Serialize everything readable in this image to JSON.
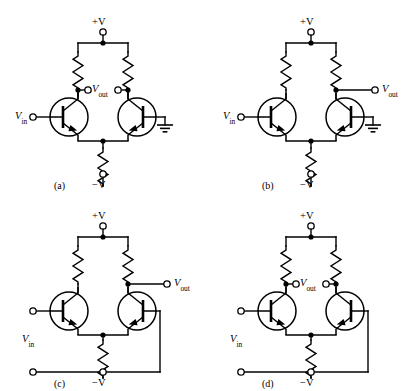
{
  "figure": {
    "background_color": "#ffffff",
    "line_color": "#000000",
    "width": 417,
    "height": 391
  },
  "labels": {
    "supply_positive": "+V",
    "supply_negative": "−V",
    "v_in_prefix": "V",
    "v_in_sub": "in",
    "v_out_prefix": "V",
    "v_out_sub": "out"
  },
  "captions": {
    "a": "(a)",
    "b": "(b)",
    "c": "(c)",
    "d": "(d)"
  },
  "circuits": [
    {
      "id": "a",
      "caption": "(a)",
      "input_mode": "single-ended",
      "output_mode": "double-ended",
      "input_terminals": 1,
      "output_terminals": 2,
      "grounded_base": "right",
      "feedback_wire": false,
      "supply_top": "+V",
      "supply_bottom": "−V",
      "input_label": "V",
      "input_sub": "in",
      "output_label": "V",
      "output_sub": "out",
      "transistors": 2,
      "resistors": 3,
      "ground_symbol": true
    },
    {
      "id": "b",
      "caption": "(b)",
      "input_mode": "single-ended",
      "output_mode": "single-ended",
      "input_terminals": 1,
      "output_terminals": 1,
      "grounded_base": "right",
      "feedback_wire": false,
      "supply_top": "+V",
      "supply_bottom": "−V",
      "input_label": "V",
      "input_sub": "in",
      "output_label": "V",
      "output_sub": "out",
      "transistors": 2,
      "resistors": 3,
      "ground_symbol": true
    },
    {
      "id": "c",
      "caption": "(c)",
      "input_mode": "double-ended",
      "output_mode": "single-ended",
      "input_terminals": 2,
      "output_terminals": 1,
      "grounded_base": "none",
      "feedback_wire": true,
      "supply_top": "+V",
      "supply_bottom": "−V",
      "input_label": "V",
      "input_sub": "in",
      "output_label": "V",
      "output_sub": "out",
      "transistors": 2,
      "resistors": 3,
      "ground_symbol": false
    },
    {
      "id": "d",
      "caption": "(d)",
      "input_mode": "double-ended",
      "output_mode": "double-ended",
      "input_terminals": 2,
      "output_terminals": 2,
      "grounded_base": "none",
      "feedback_wire": true,
      "supply_top": "+V",
      "supply_bottom": "−V",
      "input_label": "V",
      "input_sub": "in",
      "output_label": "V",
      "output_sub": "out",
      "transistors": 2,
      "resistors": 3,
      "ground_symbol": false
    }
  ]
}
